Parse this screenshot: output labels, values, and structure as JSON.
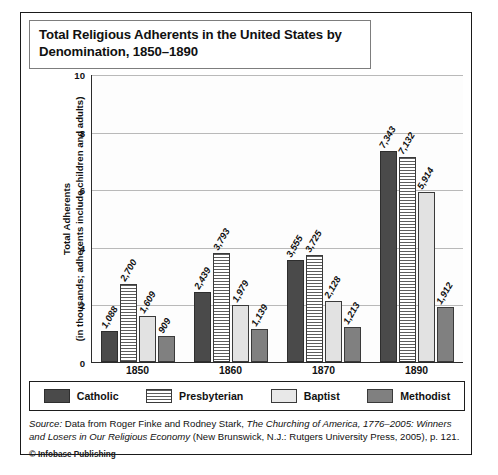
{
  "title": "Total Religious Adherents in the United States by Denomination, 1850–1890",
  "axis": {
    "ylabel_line1": "Total Adherents",
    "ylabel_line2": "(in thousands; adherents include children and adults)",
    "yticks": [
      "10",
      "8",
      "6",
      "4",
      "2",
      "0"
    ]
  },
  "legend": {
    "items": [
      {
        "label": "Catholic",
        "swatch": "catholic-swatch",
        "color": "#4a4a4a"
      },
      {
        "label": "Presbyterian",
        "swatch": "presbyterian-swatch",
        "color": "#ffffff"
      },
      {
        "label": "Baptist",
        "swatch": "baptist-swatch",
        "color": "#e8e8e8"
      },
      {
        "label": "Methodist",
        "swatch": "methodist-swatch",
        "color": "#808080"
      }
    ]
  },
  "source": {
    "prefix": "Source:",
    "body_1": " Data from Roger Finke and Rodney Stark, ",
    "work": "The Churching of America, 1776–2005: Winners and Losers in Our Religious Economy",
    "body_2": " (New Brunswick, N.J.: Rutgers University Press, 2005), p. 121.",
    "copyright": "Infobase Publishing",
    "copyright_mark": "©"
  },
  "chart_data": {
    "type": "bar",
    "title": "Total Religious Adherents in the United States by Denomination, 1850–1890",
    "xlabel": "",
    "ylabel": "Total Adherents (in thousands; adherents include children and adults)",
    "ylim": [
      0,
      10
    ],
    "ytick_values": [
      0,
      2,
      4,
      6,
      8,
      10
    ],
    "grid": true,
    "legend_position": "bottom",
    "categories": [
      "1850",
      "1860",
      "1870",
      "1890"
    ],
    "series": [
      {
        "name": "Catholic",
        "values": [
          1088,
          2439,
          3555,
          7343
        ],
        "labels": [
          "1,088",
          "2,439",
          "3,555",
          "7,343"
        ]
      },
      {
        "name": "Presbyterian",
        "values": [
          2700,
          3793,
          3725,
          7132
        ],
        "labels": [
          "2,700",
          "3,793",
          "3,725",
          "7,132"
        ]
      },
      {
        "name": "Baptist",
        "values": [
          1609,
          1979,
          2128,
          5914
        ],
        "labels": [
          "1,609",
          "1,979",
          "2,128",
          "5,914"
        ]
      },
      {
        "name": "Methodist",
        "values": [
          909,
          1139,
          1213,
          1912
        ],
        "labels": [
          "909",
          "1,139",
          "1,213",
          "1,912"
        ]
      }
    ],
    "value_unit": "thousands",
    "note": "Bar heights are in thousands; axis is scaled 0–10 thousand."
  }
}
